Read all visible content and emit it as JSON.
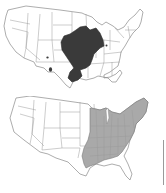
{
  "figure": {
    "panels": [
      {
        "id": "top",
        "description": "United States map with dark-shaded range in the central Mississippi valley / Midwest",
        "range_color": "#3a3a3a",
        "outline_color": "#8a8a8a",
        "regions": [
          "central-midwest-range",
          "oklahoma-spot",
          "texas-spot",
          "ohio-spot"
        ]
      },
      {
        "id": "bottom",
        "description": "United States map with light-gray shaded range covering the eastern United States",
        "range_color": "#a9a9a9",
        "outline_color": "#8a8a8a",
        "regions": [
          "eastern-us-range"
        ]
      }
    ]
  }
}
